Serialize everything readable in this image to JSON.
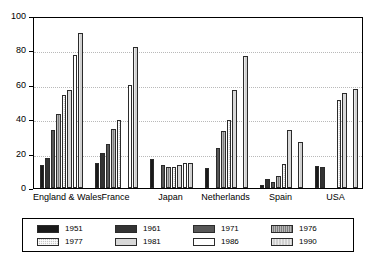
{
  "chart_data": {
    "type": "bar",
    "title": "",
    "subtitle": "",
    "xlabel": "",
    "ylabel": "",
    "ylim": [
      0,
      100
    ],
    "yticks": [
      0,
      20,
      40,
      60,
      80,
      100
    ],
    "grid": "horizontal-dotted",
    "legend_position": "bottom",
    "categories": [
      "England & Wales",
      "France",
      "Japan",
      "Netherlands",
      "Spain",
      "USA"
    ],
    "series": [
      {
        "name": "1951",
        "color": "#1a1a1a",
        "values": [
          13.5,
          14.5,
          17.0,
          11.5,
          1.5,
          13.0
        ]
      },
      {
        "name": "1961",
        "color": "#333333",
        "values": [
          17.5,
          20.5,
          null,
          null,
          5.0,
          12.5
        ]
      },
      {
        "name": "1971",
        "color": "#575757",
        "values": [
          33.5,
          25.5,
          13.5,
          23.5,
          3.5,
          null
        ]
      },
      {
        "name": "1976",
        "color": "#7d7d7d",
        "values": [
          43.0,
          34.5,
          12.5,
          33.0,
          7.0,
          null
        ]
      },
      {
        "name": "1977",
        "color": "#c8c8c8",
        "values": [
          54.0,
          39.5,
          12.5,
          39.5,
          14.0,
          51.0
        ]
      },
      {
        "name": "1981",
        "color": "#d8d8d8",
        "values": [
          57.0,
          null,
          13.5,
          57.0,
          34.0,
          55.0
        ]
      },
      {
        "name": "1986",
        "color": "#ffffff",
        "values": [
          77.5,
          60.0,
          14.5,
          null,
          null,
          null
        ]
      },
      {
        "name": "1990",
        "color": "#d0d0d0",
        "values": [
          90.0,
          82.0,
          14.5,
          77.0,
          27.0,
          57.5
        ]
      }
    ]
  },
  "axis": {
    "y_tick_labels": [
      "0",
      "20",
      "40",
      "60",
      "80",
      "100"
    ]
  },
  "legend": {
    "items": [
      {
        "label": "1951"
      },
      {
        "label": "1961"
      },
      {
        "label": "1971"
      },
      {
        "label": "1976"
      },
      {
        "label": "1977"
      },
      {
        "label": "1981"
      },
      {
        "label": "1986"
      },
      {
        "label": "1990"
      }
    ]
  }
}
